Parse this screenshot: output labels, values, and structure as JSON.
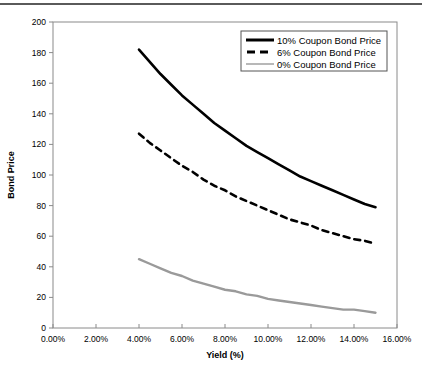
{
  "chart_data": {
    "type": "line",
    "title": "",
    "xlabel": "Yield (%)",
    "ylabel": "Bond Price",
    "xlim": [
      0,
      16
    ],
    "ylim": [
      0,
      200
    ],
    "xticks": [
      "0.00%",
      "2.00%",
      "4.00%",
      "6.00%",
      "8.00%",
      "10.00%",
      "12.00%",
      "14.00%",
      "16.00%"
    ],
    "xtick_values": [
      0,
      2,
      4,
      6,
      8,
      10,
      12,
      14,
      16
    ],
    "yticks": [
      "0",
      "20",
      "40",
      "60",
      "80",
      "100",
      "120",
      "140",
      "160",
      "180",
      "200"
    ],
    "ytick_values": [
      0,
      20,
      40,
      60,
      80,
      100,
      120,
      140,
      160,
      180,
      200
    ],
    "grid": false,
    "legend_position": "top-right",
    "series": [
      {
        "name": "10% Coupon Bond Price",
        "style": "solid",
        "color": "#000000",
        "width": 2.6,
        "x": [
          4,
          4.5,
          5,
          5.5,
          6,
          6.5,
          7,
          7.5,
          8,
          8.5,
          9,
          9.5,
          10,
          10.5,
          11,
          11.5,
          12,
          12.5,
          13,
          13.5,
          14,
          14.5,
          15
        ],
        "y": [
          182,
          174,
          166,
          159,
          152,
          146,
          140,
          134,
          129,
          124,
          119,
          115,
          111,
          107,
          103,
          99,
          96,
          93,
          90,
          87,
          84,
          81,
          79
        ]
      },
      {
        "name": "6% Coupon Bond Price",
        "style": "dashed",
        "color": "#000000",
        "width": 2.6,
        "x": [
          4,
          4.5,
          5,
          5.5,
          6,
          6.5,
          7,
          7.5,
          8,
          8.5,
          9,
          9.5,
          10,
          10.5,
          11,
          11.5,
          12,
          12.5,
          13,
          13.5,
          14,
          14.5,
          15
        ],
        "y": [
          127,
          121,
          116,
          111,
          106,
          102,
          97,
          93,
          90,
          86,
          83,
          80,
          77,
          74,
          71,
          69,
          67,
          64,
          62,
          60,
          58,
          57,
          55
        ]
      },
      {
        "name": "0% Coupon Bond Price",
        "style": "solid",
        "color": "#9a9a9a",
        "width": 2.4,
        "x": [
          4,
          4.5,
          5,
          5.5,
          6,
          6.5,
          7,
          7.5,
          8,
          8.5,
          9,
          9.5,
          10,
          10.5,
          11,
          11.5,
          12,
          12.5,
          13,
          13.5,
          14,
          14.5,
          15
        ],
        "y": [
          45,
          42,
          39,
          36,
          34,
          31,
          29,
          27,
          25,
          24,
          22,
          21,
          19,
          18,
          17,
          16,
          15,
          14,
          13,
          12,
          12,
          11,
          10
        ]
      }
    ]
  },
  "legend": {
    "items": [
      {
        "label": "10% Coupon Bond Price",
        "style": "solid",
        "color": "#000000"
      },
      {
        "label": "6% Coupon Bond Price",
        "style": "dashed",
        "color": "#000000"
      },
      {
        "label": "0% Coupon Bond Price",
        "style": "solid",
        "color": "#9a9a9a"
      }
    ]
  }
}
